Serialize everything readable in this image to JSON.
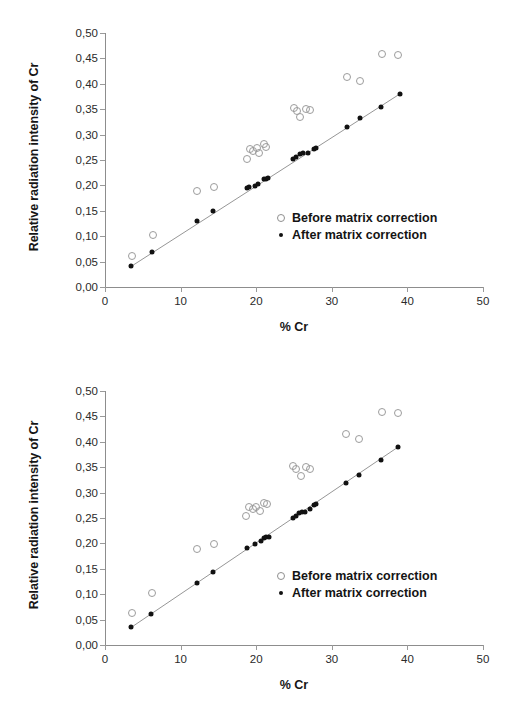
{
  "figure": {
    "panel_count": 2,
    "background": "#ffffff"
  },
  "chart_data": [
    {
      "type": "scatter",
      "panel": "top",
      "title": "",
      "xlabel": "% Cr",
      "ylabel": "Relative radiation intensity of Cr",
      "xlim": [
        0,
        50
      ],
      "ylim": [
        0.0,
        0.5
      ],
      "xticks": [
        0,
        10,
        20,
        30,
        40,
        50
      ],
      "yticks": [
        0.0,
        0.05,
        0.1,
        0.15,
        0.2,
        0.25,
        0.3,
        0.35,
        0.4,
        0.45,
        0.5
      ],
      "xticklabels": [
        "0",
        "10",
        "20",
        "30",
        "40",
        "50"
      ],
      "yticklabels": [
        "0,00",
        "0,05",
        "0,10",
        "0,15",
        "0,20",
        "0,25",
        "0,30",
        "0,35",
        "0,40",
        "0,45",
        "0,50"
      ],
      "grid": false,
      "legend_position": "lower right inside",
      "trendline": {
        "series": "After matrix correction",
        "x": [
          3.4,
          39.0
        ],
        "y": [
          0.04,
          0.38
        ]
      },
      "series": [
        {
          "name": "Before matrix correction",
          "marker": "open-circle",
          "color": "#9c9c9c",
          "points": [
            {
              "x": 3.6,
              "y": 0.062
            },
            {
              "x": 6.3,
              "y": 0.102
            },
            {
              "x": 12.2,
              "y": 0.189
            },
            {
              "x": 14.4,
              "y": 0.197
            },
            {
              "x": 18.8,
              "y": 0.252
            },
            {
              "x": 19.2,
              "y": 0.271
            },
            {
              "x": 19.6,
              "y": 0.268
            },
            {
              "x": 20.1,
              "y": 0.273
            },
            {
              "x": 20.4,
              "y": 0.264
            },
            {
              "x": 21.0,
              "y": 0.281
            },
            {
              "x": 21.3,
              "y": 0.276
            },
            {
              "x": 25.0,
              "y": 0.352
            },
            {
              "x": 25.4,
              "y": 0.347
            },
            {
              "x": 25.8,
              "y": 0.334
            },
            {
              "x": 26.6,
              "y": 0.351
            },
            {
              "x": 27.1,
              "y": 0.348
            },
            {
              "x": 32.0,
              "y": 0.414
            },
            {
              "x": 33.7,
              "y": 0.406
            },
            {
              "x": 36.7,
              "y": 0.458
            },
            {
              "x": 38.8,
              "y": 0.457
            }
          ]
        },
        {
          "name": "After matrix correction",
          "marker": "filled-circle",
          "color": "#111111",
          "points": [
            {
              "x": 3.4,
              "y": 0.041
            },
            {
              "x": 6.2,
              "y": 0.068
            },
            {
              "x": 12.2,
              "y": 0.13
            },
            {
              "x": 14.3,
              "y": 0.15
            },
            {
              "x": 18.8,
              "y": 0.194
            },
            {
              "x": 19.1,
              "y": 0.196
            },
            {
              "x": 19.9,
              "y": 0.199
            },
            {
              "x": 20.3,
              "y": 0.202
            },
            {
              "x": 21.0,
              "y": 0.212
            },
            {
              "x": 21.3,
              "y": 0.213
            },
            {
              "x": 21.6,
              "y": 0.214
            },
            {
              "x": 24.9,
              "y": 0.252
            },
            {
              "x": 25.3,
              "y": 0.256
            },
            {
              "x": 25.8,
              "y": 0.262
            },
            {
              "x": 26.2,
              "y": 0.264
            },
            {
              "x": 26.8,
              "y": 0.263
            },
            {
              "x": 27.6,
              "y": 0.272
            },
            {
              "x": 27.9,
              "y": 0.274
            },
            {
              "x": 32.0,
              "y": 0.315
            },
            {
              "x": 33.7,
              "y": 0.332
            },
            {
              "x": 36.5,
              "y": 0.355
            },
            {
              "x": 39.0,
              "y": 0.379
            }
          ]
        }
      ]
    },
    {
      "type": "scatter",
      "panel": "bottom",
      "title": "",
      "xlabel": "% Cr",
      "ylabel": "Relative radiation intensity of Cr",
      "xlim": [
        0,
        50
      ],
      "ylim": [
        0.0,
        0.5
      ],
      "xticks": [
        0,
        10,
        20,
        30,
        40,
        50
      ],
      "yticks": [
        0.0,
        0.05,
        0.1,
        0.15,
        0.2,
        0.25,
        0.3,
        0.35,
        0.4,
        0.45,
        0.5
      ],
      "xticklabels": [
        "0",
        "10",
        "20",
        "30",
        "40",
        "50"
      ],
      "yticklabels": [
        "0,00",
        "0,05",
        "0,10",
        "0,15",
        "0,20",
        "0,25",
        "0,30",
        "0,35",
        "0,40",
        "0,45",
        "0,50"
      ],
      "grid": false,
      "legend_position": "lower right inside",
      "trendline": {
        "series": "After matrix correction",
        "x": [
          3.5,
          38.8
        ],
        "y": [
          0.035,
          0.39
        ]
      },
      "series": [
        {
          "name": "Before matrix correction",
          "marker": "open-circle",
          "color": "#9c9c9c",
          "points": [
            {
              "x": 3.6,
              "y": 0.063
            },
            {
              "x": 6.2,
              "y": 0.103
            },
            {
              "x": 12.2,
              "y": 0.189
            },
            {
              "x": 14.4,
              "y": 0.199
            },
            {
              "x": 18.7,
              "y": 0.253
            },
            {
              "x": 19.1,
              "y": 0.271
            },
            {
              "x": 19.6,
              "y": 0.268
            },
            {
              "x": 20.0,
              "y": 0.272
            },
            {
              "x": 20.5,
              "y": 0.264
            },
            {
              "x": 21.0,
              "y": 0.28
            },
            {
              "x": 21.4,
              "y": 0.277
            },
            {
              "x": 24.9,
              "y": 0.352
            },
            {
              "x": 25.3,
              "y": 0.346
            },
            {
              "x": 25.9,
              "y": 0.333
            },
            {
              "x": 26.6,
              "y": 0.351
            },
            {
              "x": 27.1,
              "y": 0.347
            },
            {
              "x": 31.9,
              "y": 0.415
            },
            {
              "x": 33.6,
              "y": 0.405
            },
            {
              "x": 36.6,
              "y": 0.458
            },
            {
              "x": 38.8,
              "y": 0.457
            }
          ]
        },
        {
          "name": "After matrix correction",
          "marker": "filled-circle",
          "color": "#111111",
          "points": [
            {
              "x": 3.5,
              "y": 0.035
            },
            {
              "x": 6.1,
              "y": 0.061
            },
            {
              "x": 12.2,
              "y": 0.122
            },
            {
              "x": 14.3,
              "y": 0.144
            },
            {
              "x": 18.8,
              "y": 0.19
            },
            {
              "x": 19.9,
              "y": 0.199
            },
            {
              "x": 20.6,
              "y": 0.205
            },
            {
              "x": 21.0,
              "y": 0.21
            },
            {
              "x": 21.3,
              "y": 0.212
            },
            {
              "x": 21.7,
              "y": 0.213
            },
            {
              "x": 24.9,
              "y": 0.25
            },
            {
              "x": 25.3,
              "y": 0.254
            },
            {
              "x": 25.7,
              "y": 0.259
            },
            {
              "x": 26.1,
              "y": 0.262
            },
            {
              "x": 26.5,
              "y": 0.262
            },
            {
              "x": 27.1,
              "y": 0.268
            },
            {
              "x": 27.6,
              "y": 0.276
            },
            {
              "x": 27.9,
              "y": 0.278
            },
            {
              "x": 31.9,
              "y": 0.318
            },
            {
              "x": 33.6,
              "y": 0.335
            },
            {
              "x": 36.5,
              "y": 0.365
            },
            {
              "x": 38.8,
              "y": 0.39
            }
          ]
        }
      ]
    }
  ],
  "legend": {
    "before_label": "Before matrix correction",
    "after_label": "After matrix correction"
  }
}
